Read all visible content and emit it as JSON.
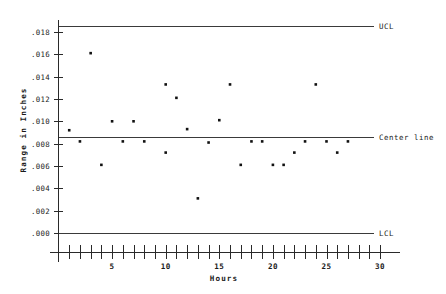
{
  "chart_data": {
    "type": "scatter",
    "title": "",
    "subtitle": "",
    "xlabel": "Hours",
    "ylabel": "Range in Inches",
    "xlim": [
      0,
      31
    ],
    "ylim": [
      0.0,
      0.0195
    ],
    "grid": false,
    "legend_position": "right-inline",
    "x": [
      1,
      2,
      3,
      4,
      5,
      6,
      7,
      8,
      10,
      10,
      11,
      12,
      13,
      14,
      15,
      16,
      17,
      18,
      19,
      20,
      21,
      22,
      23,
      24,
      25,
      26,
      27
    ],
    "values": [
      0.0092,
      0.0082,
      0.0161,
      0.0061,
      0.01,
      0.0082,
      0.01,
      0.0082,
      0.0133,
      0.0072,
      0.0121,
      0.0093,
      0.0031,
      0.0081,
      0.0101,
      0.0133,
      0.0061,
      0.0082,
      0.0082,
      0.0061,
      0.0061,
      0.0072,
      0.0082,
      0.0133,
      0.0082,
      0.0072,
      0.0082
    ],
    "points": [
      {
        "hour": 1,
        "range": 0.0092
      },
      {
        "hour": 2,
        "range": 0.0082
      },
      {
        "hour": 3,
        "range": 0.0161
      },
      {
        "hour": 4,
        "range": 0.0061
      },
      {
        "hour": 5,
        "range": 0.01
      },
      {
        "hour": 6,
        "range": 0.0082
      },
      {
        "hour": 7,
        "range": 0.01
      },
      {
        "hour": 8,
        "range": 0.0082
      },
      {
        "hour": 10,
        "range": 0.0133
      },
      {
        "hour": 10,
        "range": 0.0072
      },
      {
        "hour": 11,
        "range": 0.0121
      },
      {
        "hour": 12,
        "range": 0.0093
      },
      {
        "hour": 13,
        "range": 0.0031
      },
      {
        "hour": 14,
        "range": 0.0081
      },
      {
        "hour": 15,
        "range": 0.0101
      },
      {
        "hour": 16,
        "range": 0.0133
      },
      {
        "hour": 17,
        "range": 0.0061
      },
      {
        "hour": 18,
        "range": 0.0082
      },
      {
        "hour": 19,
        "range": 0.0082
      },
      {
        "hour": 20,
        "range": 0.0061
      },
      {
        "hour": 21,
        "range": 0.0061
      },
      {
        "hour": 22,
        "range": 0.0072
      },
      {
        "hour": 23,
        "range": 0.0082
      },
      {
        "hour": 24,
        "range": 0.0133
      },
      {
        "hour": 25,
        "range": 0.0082
      },
      {
        "hour": 26,
        "range": 0.0072
      },
      {
        "hour": 27,
        "range": 0.0082
      }
    ],
    "control_limits": [
      {
        "name": "UCL",
        "label": "UCL",
        "value": 0.0185
      },
      {
        "name": "center-line",
        "label": "Center line",
        "value": 0.0086
      },
      {
        "name": "LCL",
        "label": "LCL",
        "value": 0.0
      }
    ],
    "ytick_labels": [
      ".018",
      ".016",
      ".014",
      ".012",
      ".010",
      ".008",
      ".006",
      ".004",
      ".002",
      ".000"
    ],
    "ytick_values": [
      0.018,
      0.016,
      0.014,
      0.012,
      0.01,
      0.008,
      0.006,
      0.004,
      0.002,
      0.0
    ],
    "xtick_labels": [
      "5",
      "10",
      "15",
      "20",
      "25",
      "30"
    ],
    "xtick_values": [
      5,
      10,
      15,
      20,
      25,
      30
    ],
    "xminor_tick_values": [
      1,
      2,
      3,
      4,
      5,
      6,
      7,
      8,
      9,
      10,
      11,
      12,
      13,
      14,
      15,
      16,
      17,
      18,
      19,
      20,
      21,
      22,
      23,
      24,
      25,
      26,
      27,
      28,
      29,
      30
    ],
    "marker": "square",
    "marker_color": "#111111",
    "line_color": "#3a3a3a",
    "background_color": "#ffffff"
  },
  "axes": {
    "y_title": "Range in Inches",
    "x_title": "Hours"
  }
}
